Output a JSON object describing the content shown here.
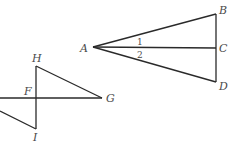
{
  "figure_1": {
    "points": {
      "A": {
        "label": "A",
        "x": 93,
        "y": 47
      },
      "B": {
        "label": "B",
        "x": 216,
        "y": 14
      },
      "C": {
        "label": "C",
        "x": 216,
        "y": 48
      },
      "D": {
        "label": "D",
        "x": 216,
        "y": 82
      }
    },
    "angle_labels": {
      "angle1": "1",
      "angle2": "2"
    }
  },
  "figure_2": {
    "points": {
      "H": {
        "label": "H",
        "x": 36,
        "y": 66
      },
      "F": {
        "label": "F",
        "x": 36,
        "y": 98
      },
      "I": {
        "label": "I",
        "x": 36,
        "y": 129
      },
      "G": {
        "label": "G",
        "x": 102,
        "y": 98
      }
    }
  }
}
